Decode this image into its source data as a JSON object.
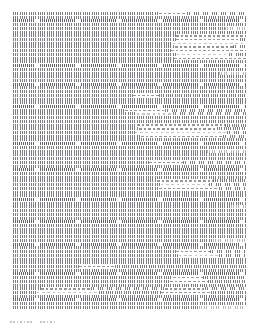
{
  "document": {
    "kind": "document-page-thumbnail",
    "page_width": 258,
    "page_height": 330,
    "background_color": "#ffffff",
    "ink_color": "#5a5a5f",
    "text_block": {
      "left": 13,
      "top": 12,
      "width": 233,
      "height": 298,
      "line_pitch": 3.72,
      "line_count": 80,
      "description": "Dense body text downscaled until glyphs merge into vertical strokes, interrupted by blocks of horizontal dash runs."
    },
    "caption": {
      "left": 10,
      "top": 319,
      "segments": [
        {
          "start": 0,
          "length": 22
        },
        {
          "start": 30,
          "length": 16
        }
      ]
    }
  },
  "chart_data": {
    "type": "heatmap",
    "title": "",
    "xlabel": "",
    "ylabel": "",
    "grid": false,
    "legend": "none",
    "x": [
      0,
      233
    ],
    "ylim": [
      0,
      80
    ],
    "note": "Each row is one text line; runs give x-start, x-width and style of ink segments across the line.",
    "styles": [
      "vert",
      "vert dense",
      "vert light",
      "horiz",
      "horiz light",
      "blank"
    ],
    "lines": [
      {
        "y": 0,
        "runs": [
          {
            "x": 0,
            "w": 146,
            "s": "vert"
          },
          {
            "x": 146,
            "w": 28,
            "s": "horiz"
          },
          {
            "x": 174,
            "w": 59,
            "s": "vert"
          }
        ]
      },
      {
        "y": 1,
        "runs": [
          {
            "x": 0,
            "w": 233,
            "s": "vert"
          }
        ]
      },
      {
        "y": 2,
        "runs": [
          {
            "x": 0,
            "w": 233,
            "s": "vert dense"
          }
        ]
      },
      {
        "y": 3,
        "runs": [
          {
            "x": 0,
            "w": 233,
            "s": "vert"
          }
        ]
      },
      {
        "y": 4,
        "runs": [
          {
            "x": 0,
            "w": 212,
            "s": "vert"
          },
          {
            "x": 212,
            "w": 21,
            "s": "vert light"
          }
        ]
      },
      {
        "y": 5,
        "runs": [
          {
            "x": 0,
            "w": 233,
            "s": "vert"
          }
        ]
      },
      {
        "y": 6,
        "runs": [
          {
            "x": 0,
            "w": 163,
            "s": "vert"
          },
          {
            "x": 163,
            "w": 70,
            "s": "horiz"
          }
        ]
      },
      {
        "y": 7,
        "runs": [
          {
            "x": 0,
            "w": 163,
            "s": "vert"
          },
          {
            "x": 163,
            "w": 64,
            "s": "horiz"
          },
          {
            "x": 227,
            "w": 6,
            "s": "vert"
          }
        ]
      },
      {
        "y": 8,
        "runs": [
          {
            "x": 0,
            "w": 160,
            "s": "vert"
          },
          {
            "x": 160,
            "w": 73,
            "s": "horiz light"
          }
        ]
      },
      {
        "y": 9,
        "runs": [
          {
            "x": 0,
            "w": 162,
            "s": "vert"
          },
          {
            "x": 162,
            "w": 58,
            "s": "horiz"
          },
          {
            "x": 220,
            "w": 13,
            "s": "vert"
          }
        ]
      },
      {
        "y": 10,
        "runs": [
          {
            "x": 0,
            "w": 158,
            "s": "vert"
          },
          {
            "x": 158,
            "w": 75,
            "s": "horiz"
          }
        ]
      },
      {
        "y": 11,
        "runs": [
          {
            "x": 0,
            "w": 164,
            "s": "vert"
          },
          {
            "x": 164,
            "w": 52,
            "s": "horiz light"
          },
          {
            "x": 216,
            "w": 17,
            "s": "vert"
          }
        ]
      },
      {
        "y": 12,
        "runs": [
          {
            "x": 0,
            "w": 161,
            "s": "vert"
          },
          {
            "x": 161,
            "w": 72,
            "s": "horiz"
          }
        ]
      },
      {
        "y": 13,
        "runs": [
          {
            "x": 0,
            "w": 233,
            "s": "vert"
          }
        ]
      },
      {
        "y": 14,
        "runs": [
          {
            "x": 0,
            "w": 233,
            "s": "vert dense"
          }
        ]
      },
      {
        "y": 15,
        "runs": [
          {
            "x": 0,
            "w": 233,
            "s": "vert"
          }
        ]
      },
      {
        "y": 16,
        "runs": [
          {
            "x": 0,
            "w": 206,
            "s": "vert"
          },
          {
            "x": 206,
            "w": 27,
            "s": "vert light"
          }
        ]
      },
      {
        "y": 17,
        "runs": [
          {
            "x": 0,
            "w": 233,
            "s": "vert"
          }
        ]
      },
      {
        "y": 18,
        "runs": [
          {
            "x": 0,
            "w": 233,
            "s": "vert"
          }
        ]
      },
      {
        "y": 19,
        "runs": [
          {
            "x": 0,
            "w": 233,
            "s": "vert dense"
          }
        ]
      },
      {
        "y": 20,
        "runs": [
          {
            "x": 0,
            "w": 233,
            "s": "vert"
          }
        ]
      },
      {
        "y": 21,
        "runs": [
          {
            "x": 0,
            "w": 233,
            "s": "vert"
          }
        ]
      },
      {
        "y": 22,
        "runs": [
          {
            "x": 0,
            "w": 120,
            "s": "vert"
          },
          {
            "x": 120,
            "w": 26,
            "s": "horiz"
          },
          {
            "x": 146,
            "w": 87,
            "s": "vert"
          }
        ]
      },
      {
        "y": 23,
        "runs": [
          {
            "x": 0,
            "w": 233,
            "s": "vert"
          }
        ]
      },
      {
        "y": 24,
        "runs": [
          {
            "x": 0,
            "w": 233,
            "s": "vert"
          }
        ]
      },
      {
        "y": 25,
        "runs": [
          {
            "x": 0,
            "w": 233,
            "s": "vert dense"
          }
        ]
      },
      {
        "y": 26,
        "runs": [
          {
            "x": 0,
            "w": 112,
            "s": "vert"
          },
          {
            "x": 112,
            "w": 40,
            "s": "horiz"
          },
          {
            "x": 152,
            "w": 81,
            "s": "vert"
          }
        ]
      },
      {
        "y": 27,
        "runs": [
          {
            "x": 0,
            "w": 124,
            "s": "vert"
          },
          {
            "x": 124,
            "w": 36,
            "s": "horiz light"
          },
          {
            "x": 160,
            "w": 73,
            "s": "vert"
          }
        ]
      },
      {
        "y": 28,
        "runs": [
          {
            "x": 0,
            "w": 233,
            "s": "vert"
          }
        ]
      },
      {
        "y": 29,
        "runs": [
          {
            "x": 0,
            "w": 233,
            "s": "vert"
          }
        ]
      },
      {
        "y": 30,
        "runs": [
          {
            "x": 0,
            "w": 124,
            "s": "vert"
          },
          {
            "x": 124,
            "w": 88,
            "s": "horiz"
          },
          {
            "x": 212,
            "w": 21,
            "s": "vert"
          }
        ]
      },
      {
        "y": 31,
        "runs": [
          {
            "x": 0,
            "w": 126,
            "s": "vert"
          },
          {
            "x": 126,
            "w": 78,
            "s": "horiz"
          },
          {
            "x": 204,
            "w": 29,
            "s": "vert"
          }
        ]
      },
      {
        "y": 32,
        "runs": [
          {
            "x": 0,
            "w": 122,
            "s": "vert"
          },
          {
            "x": 122,
            "w": 92,
            "s": "horiz light"
          },
          {
            "x": 214,
            "w": 19,
            "s": "vert"
          }
        ]
      },
      {
        "y": 33,
        "runs": [
          {
            "x": 0,
            "w": 128,
            "s": "vert"
          },
          {
            "x": 128,
            "w": 82,
            "s": "horiz"
          },
          {
            "x": 210,
            "w": 23,
            "s": "vert"
          }
        ]
      },
      {
        "y": 34,
        "runs": [
          {
            "x": 0,
            "w": 233,
            "s": "vert"
          }
        ]
      },
      {
        "y": 35,
        "runs": [
          {
            "x": 0,
            "w": 233,
            "s": "vert dense"
          }
        ]
      },
      {
        "y": 36,
        "runs": [
          {
            "x": 0,
            "w": 233,
            "s": "vert"
          }
        ]
      },
      {
        "y": 37,
        "runs": [
          {
            "x": 0,
            "w": 194,
            "s": "vert"
          },
          {
            "x": 194,
            "w": 39,
            "s": "vert light"
          }
        ]
      },
      {
        "y": 38,
        "runs": [
          {
            "x": 0,
            "w": 233,
            "s": "vert"
          }
        ]
      },
      {
        "y": 39,
        "runs": [
          {
            "x": 0,
            "w": 233,
            "s": "vert"
          }
        ]
      },
      {
        "y": 40,
        "runs": [
          {
            "x": 0,
            "w": 136,
            "s": "vert"
          },
          {
            "x": 136,
            "w": 34,
            "s": "horiz"
          },
          {
            "x": 170,
            "w": 63,
            "s": "vert"
          }
        ]
      },
      {
        "y": 41,
        "runs": [
          {
            "x": 0,
            "w": 233,
            "s": "vert"
          }
        ]
      },
      {
        "y": 42,
        "runs": [
          {
            "x": 0,
            "w": 233,
            "s": "vert dense"
          }
        ]
      },
      {
        "y": 43,
        "runs": [
          {
            "x": 0,
            "w": 233,
            "s": "vert"
          }
        ]
      },
      {
        "y": 44,
        "runs": [
          {
            "x": 0,
            "w": 233,
            "s": "vert"
          }
        ]
      },
      {
        "y": 45,
        "runs": [
          {
            "x": 0,
            "w": 144,
            "s": "vert"
          },
          {
            "x": 144,
            "w": 56,
            "s": "horiz"
          },
          {
            "x": 200,
            "w": 33,
            "s": "vert"
          }
        ]
      },
      {
        "y": 46,
        "runs": [
          {
            "x": 0,
            "w": 148,
            "s": "vert"
          },
          {
            "x": 148,
            "w": 48,
            "s": "horiz light"
          },
          {
            "x": 196,
            "w": 37,
            "s": "vert"
          }
        ]
      },
      {
        "y": 47,
        "runs": [
          {
            "x": 0,
            "w": 146,
            "s": "vert"
          },
          {
            "x": 146,
            "w": 60,
            "s": "horiz"
          },
          {
            "x": 206,
            "w": 27,
            "s": "vert"
          }
        ]
      },
      {
        "y": 48,
        "runs": [
          {
            "x": 0,
            "w": 233,
            "s": "vert"
          }
        ]
      },
      {
        "y": 49,
        "runs": [
          {
            "x": 0,
            "w": 233,
            "s": "vert"
          }
        ]
      },
      {
        "y": 50,
        "runs": [
          {
            "x": 0,
            "w": 233,
            "s": "vert dense"
          }
        ]
      },
      {
        "y": 51,
        "runs": [
          {
            "x": 0,
            "w": 233,
            "s": "vert"
          }
        ]
      },
      {
        "y": 52,
        "runs": [
          {
            "x": 0,
            "w": 218,
            "s": "vert"
          },
          {
            "x": 218,
            "w": 15,
            "s": "vert light"
          }
        ]
      },
      {
        "y": 53,
        "runs": [
          {
            "x": 0,
            "w": 233,
            "s": "vert"
          }
        ]
      },
      {
        "y": 54,
        "runs": [
          {
            "x": 0,
            "w": 233,
            "s": "vert"
          }
        ]
      },
      {
        "y": 55,
        "runs": [
          {
            "x": 0,
            "w": 233,
            "s": "vert"
          }
        ]
      },
      {
        "y": 56,
        "runs": [
          {
            "x": 0,
            "w": 233,
            "s": "vert dense"
          }
        ]
      },
      {
        "y": 57,
        "runs": [
          {
            "x": 0,
            "w": 233,
            "s": "vert"
          }
        ]
      },
      {
        "y": 58,
        "runs": [
          {
            "x": 0,
            "w": 233,
            "s": "vert"
          }
        ]
      },
      {
        "y": 59,
        "runs": [
          {
            "x": 0,
            "w": 233,
            "s": "vert"
          }
        ]
      },
      {
        "y": 60,
        "runs": [
          {
            "x": 0,
            "w": 233,
            "s": "vert"
          }
        ]
      },
      {
        "y": 61,
        "runs": [
          {
            "x": 0,
            "w": 200,
            "s": "vert"
          },
          {
            "x": 200,
            "w": 33,
            "s": "vert light"
          }
        ]
      },
      {
        "y": 62,
        "runs": [
          {
            "x": 0,
            "w": 233,
            "s": "vert dense"
          }
        ]
      },
      {
        "y": 63,
        "runs": [
          {
            "x": 0,
            "w": 233,
            "s": "vert"
          }
        ]
      },
      {
        "y": 64,
        "runs": [
          {
            "x": 0,
            "w": 163,
            "s": "vert"
          },
          {
            "x": 163,
            "w": 34,
            "s": "horiz"
          },
          {
            "x": 197,
            "w": 36,
            "s": "vert"
          }
        ]
      },
      {
        "y": 65,
        "runs": [
          {
            "x": 0,
            "w": 166,
            "s": "vert"
          },
          {
            "x": 166,
            "w": 40,
            "s": "horiz light"
          },
          {
            "x": 206,
            "w": 27,
            "s": "vert"
          }
        ]
      },
      {
        "y": 66,
        "runs": [
          {
            "x": 0,
            "w": 233,
            "s": "vert"
          }
        ]
      },
      {
        "y": 67,
        "runs": [
          {
            "x": 0,
            "w": 233,
            "s": "vert"
          }
        ]
      },
      {
        "y": 68,
        "runs": [
          {
            "x": 0,
            "w": 66,
            "s": "vert"
          },
          {
            "x": 66,
            "w": 36,
            "s": "horiz"
          },
          {
            "x": 102,
            "w": 131,
            "s": "vert"
          }
        ]
      },
      {
        "y": 69,
        "runs": [
          {
            "x": 0,
            "w": 233,
            "s": "vert"
          }
        ]
      },
      {
        "y": 70,
        "runs": [
          {
            "x": 0,
            "w": 233,
            "s": "vert dense"
          }
        ]
      },
      {
        "y": 71,
        "runs": [
          {
            "x": 0,
            "w": 160,
            "s": "vert"
          },
          {
            "x": 160,
            "w": 30,
            "s": "horiz"
          },
          {
            "x": 190,
            "w": 43,
            "s": "vert"
          }
        ]
      },
      {
        "y": 72,
        "runs": [
          {
            "x": 0,
            "w": 157,
            "s": "vert"
          },
          {
            "x": 157,
            "w": 38,
            "s": "horiz"
          },
          {
            "x": 195,
            "w": 38,
            "s": "vert"
          }
        ]
      },
      {
        "y": 73,
        "runs": [
          {
            "x": 0,
            "w": 233,
            "s": "vert"
          }
        ]
      },
      {
        "y": 74,
        "runs": [
          {
            "x": 0,
            "w": 28,
            "s": "vert"
          },
          {
            "x": 28,
            "w": 50,
            "s": "horiz"
          },
          {
            "x": 78,
            "w": 74,
            "s": "vert"
          },
          {
            "x": 152,
            "w": 40,
            "s": "horiz"
          },
          {
            "x": 192,
            "w": 41,
            "s": "vert"
          }
        ]
      },
      {
        "y": 75,
        "runs": [
          {
            "x": 0,
            "w": 24,
            "s": "vert"
          },
          {
            "x": 24,
            "w": 62,
            "s": "horiz light"
          },
          {
            "x": 86,
            "w": 62,
            "s": "vert"
          },
          {
            "x": 148,
            "w": 50,
            "s": "horiz"
          },
          {
            "x": 198,
            "w": 35,
            "s": "vert"
          }
        ]
      },
      {
        "y": 76,
        "runs": [
          {
            "x": 0,
            "w": 233,
            "s": "vert"
          }
        ]
      },
      {
        "y": 77,
        "runs": [
          {
            "x": 0,
            "w": 233,
            "s": "vert dense"
          }
        ]
      },
      {
        "y": 78,
        "runs": [
          {
            "x": 0,
            "w": 233,
            "s": "vert"
          }
        ]
      },
      {
        "y": 79,
        "runs": [
          {
            "x": 0,
            "w": 186,
            "s": "vert"
          },
          {
            "x": 186,
            "w": 47,
            "s": "vert light"
          }
        ]
      }
    ]
  }
}
